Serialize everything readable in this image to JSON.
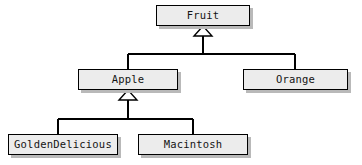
{
  "diagram": {
    "kind": "uml-class-diagram",
    "relationship": "generalization",
    "background_color": "#ffffff",
    "box_fill_color": "#ececec",
    "box_border_color": "#000000",
    "box_shadow_color": "#b9b9b9",
    "edge_color": "#000000",
    "text_color": "#141414"
  },
  "classes": [
    {
      "id": "fruit",
      "label": "Fruit",
      "x": 156,
      "y": 5,
      "w": 94,
      "h": 21
    },
    {
      "id": "apple",
      "label": "Apple",
      "x": 78,
      "y": 69,
      "w": 100,
      "h": 21
    },
    {
      "id": "orange",
      "label": "Orange",
      "x": 243,
      "y": 69,
      "w": 105,
      "h": 21
    },
    {
      "id": "goldendelicious",
      "label": "GoldenDelicious",
      "x": 8,
      "y": 134,
      "w": 110,
      "h": 21
    },
    {
      "id": "macintosh",
      "label": "Macintosh",
      "x": 138,
      "y": 134,
      "w": 110,
      "h": 21
    }
  ],
  "generalizations": [
    {
      "id": "fruit-children",
      "parent": "fruit",
      "children": [
        "apple",
        "orange"
      ],
      "arrow_x": 203,
      "arrow_tip_y": 26,
      "arrow_base_y": 36,
      "arrow_half_width": 9,
      "bus_y": 54,
      "child_xs": [
        128,
        295
      ],
      "child_top_y": 69
    },
    {
      "id": "apple-children",
      "parent": "apple",
      "children": [
        "goldendelicious",
        "macintosh"
      ],
      "arrow_x": 128,
      "arrow_tip_y": 90,
      "arrow_base_y": 100,
      "arrow_half_width": 9,
      "bus_y": 119,
      "child_xs": [
        58,
        193
      ],
      "child_top_y": 134
    }
  ]
}
